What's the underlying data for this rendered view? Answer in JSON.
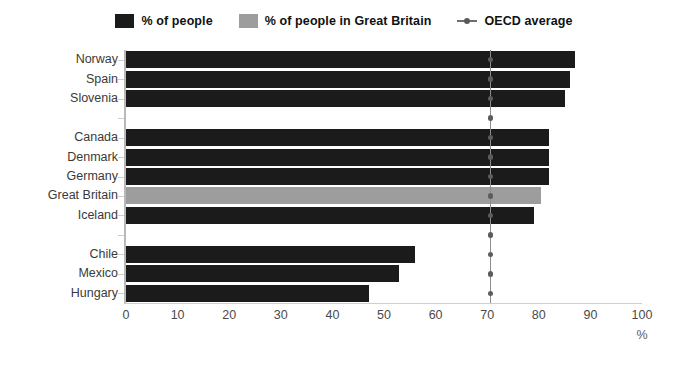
{
  "legend": {
    "items": [
      {
        "label": "% of people",
        "type": "swatch",
        "color": "#1b1b1b",
        "icon": "square-swatch-dark"
      },
      {
        "label": "% of people in Great Britain",
        "type": "swatch",
        "color": "#9d9d9d",
        "icon": "square-swatch-gray"
      },
      {
        "label": "OECD average",
        "type": "line-marker",
        "color": "#6e6e6e",
        "icon": "line-dot-marker"
      }
    ]
  },
  "chart_data": {
    "type": "bar",
    "orientation": "horizontal",
    "title": "",
    "xlabel": "%",
    "ylabel": "",
    "xlim": [
      0,
      100
    ],
    "xticks": [
      0,
      10,
      20,
      30,
      40,
      50,
      60,
      70,
      80,
      90,
      100
    ],
    "grid": false,
    "legend_position": "top-center",
    "categories": [
      "Norway",
      "Spain",
      "Slovenia",
      "",
      "Canada",
      "Denmark",
      "Germany",
      "Great Britain",
      "Iceland",
      "",
      "Chile",
      "Mexico",
      "Hungary"
    ],
    "values": [
      87,
      86,
      85,
      null,
      82,
      82,
      82,
      80.5,
      79,
      null,
      56,
      53,
      47
    ],
    "highlight_category": "Great Britain",
    "highlight_color": "#9d9d9d",
    "bar_color": "#1b1b1b",
    "reference_line": {
      "name": "OECD average",
      "value": 70.5,
      "color": "#8d8d8d",
      "marker": "dot"
    }
  }
}
